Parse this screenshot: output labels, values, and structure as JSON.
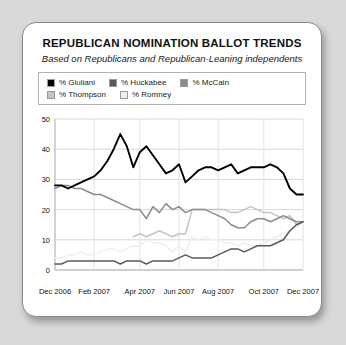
{
  "card": {
    "title": "REPUBLICAN NOMINATION BALLOT TRENDS",
    "subtitle": "Based on Republicans and Republican-Leaning independents"
  },
  "legend": {
    "rows": [
      [
        {
          "label": "% Giuliani",
          "color": "#000000"
        },
        {
          "label": "% Huckabee",
          "color": "#595959"
        },
        {
          "label": "% McCain",
          "color": "#8c8c8c"
        }
      ],
      [
        {
          "label": "% Thompson",
          "color": "#c4c4c4"
        },
        {
          "label": "% Romney",
          "color": "#efefef"
        }
      ]
    ]
  },
  "chart_data": {
    "type": "line",
    "title": "REPUBLICAN NOMINATION BALLOT TRENDS",
    "subtitle": "Based on Republicans and Republican-Leaning independents",
    "xlabel": "",
    "ylabel": "",
    "ylim": [
      0,
      50
    ],
    "yticks": [
      0,
      10,
      20,
      30,
      40,
      50
    ],
    "grid": true,
    "legend_position": "top",
    "tick_labels": [
      "Dec 2006",
      "Feb 2007",
      "Apr 2007",
      "Jun 2007",
      "Aug 2007",
      "Oct 2007",
      "Dec 2007"
    ],
    "x": [
      0,
      1,
      2,
      3,
      4,
      5,
      6,
      7,
      8,
      9,
      10,
      11,
      12,
      13,
      14,
      15,
      16,
      17,
      18,
      19,
      20,
      21,
      22,
      23,
      24,
      25,
      26,
      27,
      28,
      29,
      30,
      31,
      32,
      33,
      34,
      35,
      36,
      37,
      38
    ],
    "series": [
      {
        "name": "% Giuliani",
        "color": "#000000",
        "values": [
          28,
          28,
          27,
          28,
          29,
          30,
          31,
          33,
          36,
          40,
          45,
          41,
          34,
          39,
          41,
          38,
          35,
          32,
          33,
          35,
          29,
          31,
          33,
          34,
          34,
          33,
          34,
          35,
          32,
          33,
          34,
          34,
          34,
          35,
          34,
          32,
          27,
          25,
          25
        ]
      },
      {
        "name": "% Huckabee",
        "color": "#595959",
        "values": [
          2,
          2,
          3,
          3,
          3,
          3,
          3,
          3,
          3,
          3,
          2,
          3,
          3,
          3,
          2,
          3,
          3,
          3,
          3,
          4,
          5,
          4,
          4,
          4,
          4,
          5,
          6,
          7,
          7,
          6,
          7,
          8,
          8,
          8,
          9,
          10,
          13,
          15,
          16
        ]
      },
      {
        "name": "% McCain",
        "color": "#8c8c8c",
        "values": [
          27,
          28,
          28,
          27,
          27,
          26,
          25,
          25,
          24,
          23,
          22,
          21,
          20,
          20,
          17,
          21,
          19,
          22,
          20,
          21,
          19,
          20,
          20,
          20,
          19,
          18,
          17,
          15,
          14,
          14,
          16,
          17,
          17,
          16,
          17,
          18,
          17,
          16,
          16
        ]
      },
      {
        "name": "% Thompson",
        "color": "#c4c4c4",
        "values": [
          null,
          null,
          null,
          null,
          null,
          null,
          null,
          null,
          null,
          null,
          null,
          null,
          11,
          12,
          11,
          12,
          13,
          12,
          11,
          12,
          12,
          20,
          20,
          20,
          20,
          20,
          20,
          19,
          19,
          20,
          21,
          20,
          19,
          19,
          18,
          17,
          18,
          15,
          16
        ]
      },
      {
        "name": "% Romney",
        "color": "#efefef",
        "values": [
          4,
          4,
          5,
          5,
          6,
          5,
          5,
          6,
          7,
          7,
          6,
          7,
          8,
          8,
          10,
          9,
          9,
          8,
          6,
          8,
          6,
          11,
          10,
          11,
          10,
          10,
          9,
          9,
          8,
          9,
          8,
          8,
          9,
          10,
          11,
          12,
          13,
          14,
          16
        ]
      }
    ]
  }
}
